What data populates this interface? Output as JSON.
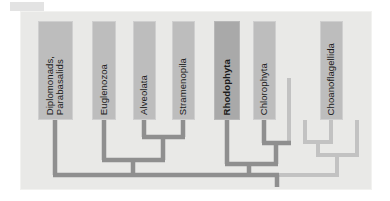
{
  "figure": {
    "name": "eukaryote-phylogeny-diagram",
    "type": "cladogram",
    "background_color": "#e9e9e7",
    "panel_border_color": "#f2f2f0",
    "branch_color_dark": "#8f8f8f",
    "branch_color_light": "#c2c2c2",
    "box_color": "#bdbdbd",
    "box_color_highlight": "#a9a9a9",
    "label_color": "#1b1b1b"
  },
  "taxa": [
    {
      "id": "diplomonads-parabasalids",
      "label": "Diplomonads,\nParabasalids",
      "highlight": false,
      "box": {
        "x": 38,
        "y": 21,
        "w": 35,
        "h": 99
      },
      "stem_x": 55
    },
    {
      "id": "euglenozoa",
      "label": "Euglenozoa",
      "highlight": false,
      "box": {
        "x": 92,
        "y": 21,
        "w": 24,
        "h": 99
      },
      "stem_x": 104
    },
    {
      "id": "alveolata",
      "label": "Alveolata",
      "highlight": false,
      "box": {
        "x": 133,
        "y": 21,
        "w": 23,
        "h": 99
      },
      "stem_x": 144
    },
    {
      "id": "stramenopila",
      "label": "Stramenopila",
      "highlight": false,
      "box": {
        "x": 172,
        "y": 21,
        "w": 23,
        "h": 99
      },
      "stem_x": 183
    },
    {
      "id": "rhodophyta",
      "label": "Rhodophyta",
      "highlight": true,
      "box": {
        "x": 214,
        "y": 21,
        "w": 26,
        "h": 99
      },
      "stem_x": 227
    },
    {
      "id": "chlorophyta",
      "label": "Chlorophyta",
      "highlight": false,
      "box": {
        "x": 253,
        "y": 21,
        "w": 23,
        "h": 99
      },
      "stem_x": 264
    },
    {
      "id": "choanoflagellida",
      "label": "Choanoflagellida",
      "highlight": false,
      "box": {
        "x": 320,
        "y": 21,
        "w": 23,
        "h": 99
      },
      "stem_x": 331
    }
  ],
  "unlabeled_tips": [
    {
      "id": "unlabeled-tip-right-of-chlorophyta",
      "stem_x": 289,
      "top_y": 78
    },
    {
      "id": "unlabeled-tip-left-of-choanoflagellida",
      "stem_x": 305,
      "top_y": 120
    },
    {
      "id": "unlabeled-tip-right-of-choanoflagellida",
      "stem_x": 357,
      "top_y": 120
    }
  ],
  "nodes": [
    {
      "id": "node-alveolata-stramenopila",
      "x": 163,
      "y": 137,
      "children": [
        "alveolata",
        "stramenopila"
      ]
    },
    {
      "id": "node-euglenozoa-clade",
      "x": 133,
      "y": 160,
      "children": [
        "euglenozoa",
        "node-alveolata-stramenopila"
      ]
    },
    {
      "id": "node-rhodophyta-chlorophyta-clade",
      "x": 249,
      "y": 164,
      "children": [
        "rhodophyta",
        "node-chlorophyta-unlabeled"
      ]
    },
    {
      "id": "node-chlorophyta-unlabeled",
      "x": 276,
      "y": 143,
      "children": [
        "chlorophyta",
        "unlabeled-tip-right-of-chlorophyta"
      ]
    },
    {
      "id": "node-choanoflagellida-clade",
      "x": 331,
      "y": 142,
      "children": [
        "unlabeled-tip-left-of-choanoflagellida",
        "choanoflagellida",
        "unlabeled-tip-right-of-choanoflagellida"
      ]
    },
    {
      "id": "node-root",
      "x": 277,
      "y": 175,
      "children": [
        "diplomonads-parabasalids",
        "node-euglenozoa-clade",
        "node-rhodophyta-chlorophyta-clade",
        "node-choanoflagellida-clade"
      ]
    }
  ],
  "root_stub": {
    "x": 277,
    "y_top": 175,
    "y_bottom": 187
  }
}
